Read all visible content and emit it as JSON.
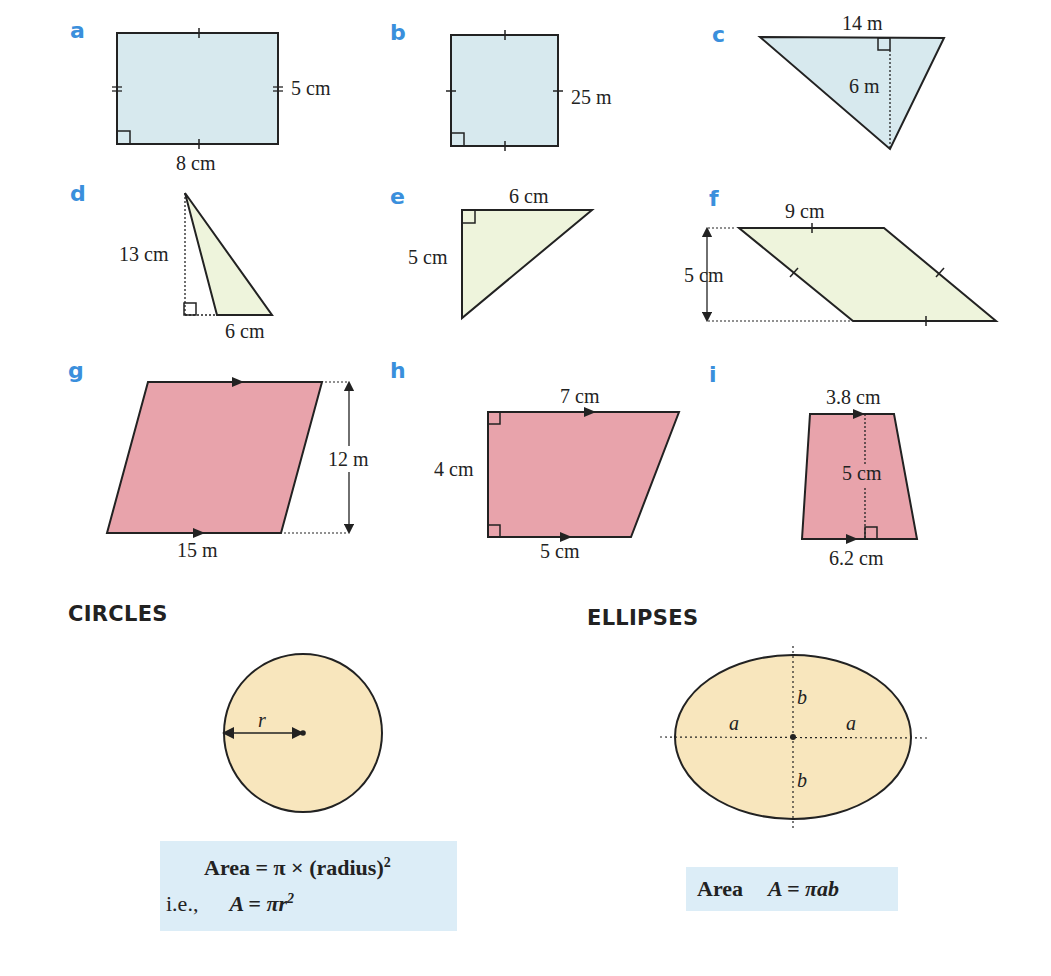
{
  "colors": {
    "label_blue": "#3a8fdc",
    "blue_fill": "#d7e9ee",
    "green_fill": "#eef4dc",
    "pink_fill": "#e8a3ab",
    "tan_fill": "#f8e6bd",
    "formula_bg": "#dcedf7"
  },
  "shapes": [
    {
      "id": "a",
      "type": "rectangle",
      "dims": [
        "5 cm",
        "8 cm"
      ]
    },
    {
      "id": "b",
      "type": "square",
      "dims": [
        "25 m"
      ]
    },
    {
      "id": "c",
      "type": "triangle",
      "dims": [
        "14 m",
        "6 m"
      ]
    },
    {
      "id": "d",
      "type": "triangle",
      "dims": [
        "13 cm",
        "6 cm"
      ]
    },
    {
      "id": "e",
      "type": "right-triangle",
      "dims": [
        "6 cm",
        "5 cm"
      ]
    },
    {
      "id": "f",
      "type": "parallelogram",
      "dims": [
        "9 cm",
        "5 cm"
      ]
    },
    {
      "id": "g",
      "type": "parallelogram",
      "dims": [
        "12 m",
        "15 m"
      ]
    },
    {
      "id": "h",
      "type": "trapezium",
      "dims": [
        "7 cm",
        "4 cm",
        "5 cm"
      ]
    },
    {
      "id": "i",
      "type": "trapezium",
      "dims": [
        "3.8 cm",
        "5 cm",
        "6.2 cm"
      ]
    }
  ],
  "circles": {
    "heading": "CIRCLES",
    "radius_label": "r",
    "formula_line1_word": "Area",
    "formula_line1_rest": " = π × (radius)",
    "formula_line1_exp": "2",
    "formula_line2_prefix": "i.e.,",
    "formula_line2_expr": "A = πr",
    "formula_line2_exp": "2"
  },
  "ellipses": {
    "heading": "ELLIPSES",
    "semi_axis_a": "a",
    "semi_axis_b": "b",
    "formula_word": "Area",
    "formula_expr": "A = πab"
  }
}
